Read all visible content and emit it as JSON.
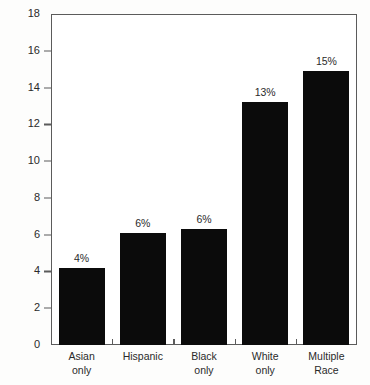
{
  "chart_data": {
    "type": "bar",
    "title": "",
    "xlabel": "",
    "ylabel": "Percent aged 18–66 with hearing loss",
    "categories": [
      "Asian only",
      "Hispanic",
      "Black only",
      "White only",
      "Multiple Race"
    ],
    "category_lines": [
      [
        "Asian",
        "only"
      ],
      [
        "Hispanic",
        ""
      ],
      [
        "Black",
        "only"
      ],
      [
        "White",
        "only"
      ],
      [
        "Multiple",
        "Race"
      ]
    ],
    "values": [
      4.2,
      6.1,
      6.3,
      13.2,
      14.9
    ],
    "data_labels": [
      "4%",
      "6%",
      "6%",
      "13%",
      "15%"
    ],
    "ylim": [
      0,
      18
    ],
    "ytick_values": [
      0,
      2,
      4,
      6,
      8,
      10,
      12,
      14,
      16,
      18
    ],
    "ytick_labels": [
      "0",
      "2",
      "4",
      "6",
      "8",
      "10",
      "12",
      "14",
      "16",
      "18"
    ],
    "grid": false,
    "legend": null,
    "bar_color": "#0b0b0b",
    "axis_color": "#5b5b5b",
    "background_color": "#ffffff"
  }
}
